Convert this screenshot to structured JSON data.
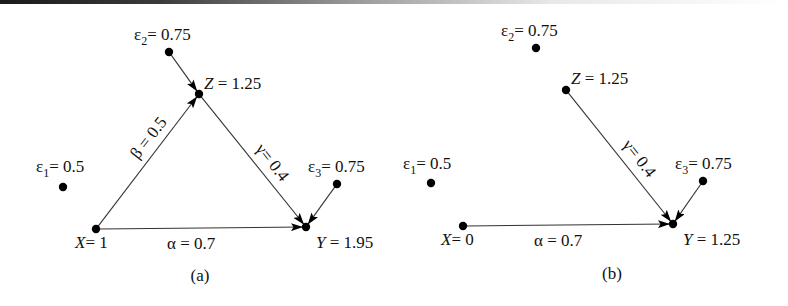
{
  "panels": [
    {
      "caption": "(a)",
      "caption_pos": [
        200,
        281
      ],
      "nodes": [
        {
          "id": "e2",
          "sym": "ε",
          "sub": "2",
          "eq": "= 0.75",
          "x": 169,
          "y": 52,
          "lx": 134,
          "ly": 40
        },
        {
          "id": "Z",
          "sym": "Z",
          "sub": "",
          "eq": " = 1.25",
          "x": 199,
          "y": 94,
          "lx": 204,
          "ly": 89
        },
        {
          "id": "e1",
          "sym": "ε",
          "sub": "1",
          "eq": "= 0.5",
          "x": 63,
          "y": 187,
          "lx": 36,
          "ly": 172
        },
        {
          "id": "X",
          "sym": "X",
          "sub": "",
          "eq": "= 1",
          "x": 96,
          "y": 229,
          "lx": 75,
          "ly": 248
        },
        {
          "id": "e3",
          "sym": "ε",
          "sub": "3",
          "eq": "= 0.75",
          "x": 337,
          "y": 184,
          "lx": 308,
          "ly": 172
        },
        {
          "id": "Y",
          "sym": "Y",
          "sub": "",
          "eq": " = 1.95",
          "x": 306,
          "y": 227,
          "lx": 316,
          "ly": 248
        }
      ],
      "edges": [
        {
          "from": "e2",
          "to": "Z"
        },
        {
          "from": "X",
          "to": "Z",
          "label": "β = 0.5",
          "lx": 138,
          "ly": 160,
          "angle": -52
        },
        {
          "from": "Z",
          "to": "Y",
          "label": "γ= 0.4",
          "lx": 255,
          "ly": 149,
          "angle": 52
        },
        {
          "from": "X",
          "to": "Y",
          "label": "α = 0.7",
          "lx": 167,
          "ly": 249,
          "angle": 0
        },
        {
          "from": "e3",
          "to": "Y"
        }
      ]
    },
    {
      "caption": "(b)",
      "caption_pos": [
        612,
        279
      ],
      "nodes": [
        {
          "id": "e2",
          "sym": "ε",
          "sub": "2",
          "eq": "= 0.75",
          "x": 536,
          "y": 48,
          "lx": 501,
          "ly": 36
        },
        {
          "id": "Z",
          "sym": "Z",
          "sub": "",
          "eq": " = 1.25",
          "x": 566,
          "y": 90,
          "lx": 571,
          "ly": 84
        },
        {
          "id": "e1",
          "sym": "ε",
          "sub": "1",
          "eq": "= 0.5",
          "x": 431,
          "y": 183,
          "lx": 403,
          "ly": 169
        },
        {
          "id": "X",
          "sym": "X",
          "sub": "",
          "eq": "= 0",
          "x": 463,
          "y": 226,
          "lx": 441,
          "ly": 245
        },
        {
          "id": "e3",
          "sym": "ε",
          "sub": "3",
          "eq": "= 0.75",
          "x": 703,
          "y": 181,
          "lx": 675,
          "ly": 169
        },
        {
          "id": "Y",
          "sym": "Y",
          "sub": "",
          "eq": " = 1.25",
          "x": 673,
          "y": 224,
          "lx": 683,
          "ly": 245
        }
      ],
      "edges": [
        {
          "from": "Z",
          "to": "Y",
          "label": "γ= 0.4",
          "lx": 622,
          "ly": 145,
          "angle": 52
        },
        {
          "from": "X",
          "to": "Y",
          "label": "α = 0.7",
          "lx": 534,
          "ly": 246,
          "angle": 0
        },
        {
          "from": "e3",
          "to": "Y"
        }
      ]
    }
  ]
}
